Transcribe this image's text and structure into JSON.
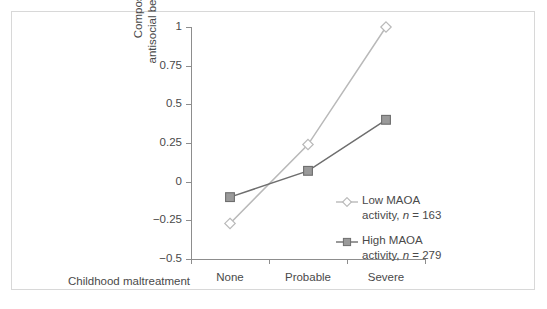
{
  "figure": {
    "frame_color": "#d8d8d8",
    "background": "#ffffff"
  },
  "chart_data": {
    "type": "line",
    "title": "",
    "xlabel": "Childhood maltreatment",
    "ylabel": "Composite index of antisocial behavior (z scores)",
    "ylabel_line1": "Composite index of",
    "ylabel_line2": "antisocial behavior (z scores)",
    "categories": [
      "None",
      "Probable",
      "Severe"
    ],
    "x": [
      0,
      1,
      2
    ],
    "ylim": [
      -0.5,
      1
    ],
    "yticks": [
      1,
      0.75,
      0.5,
      0.25,
      0,
      -0.25,
      -0.5
    ],
    "ytick_labels": [
      "1",
      "0.75",
      "0.5",
      "0.25",
      "0",
      "−0.25",
      "−0.5"
    ],
    "grid": false,
    "legend_position": "inside-right-center",
    "series": [
      {
        "name": "Low MAOA activity, n = 163",
        "label_line1": "Low MAOA",
        "label_line2_prefix": "activity, ",
        "label_line2_italic": "n",
        "label_line2_suffix": " = 163",
        "n": 163,
        "marker": "open-diamond",
        "color": "#b9b9b9",
        "marker_fill": "#ffffff",
        "values": [
          -0.27,
          0.24,
          1.0
        ]
      },
      {
        "name": "High MAOA activity, n = 279",
        "label_line1": "High MAOA",
        "label_line2_prefix": "activity, ",
        "label_line2_italic": "n",
        "label_line2_suffix": " = 279",
        "n": 279,
        "marker": "filled-square",
        "color": "#6e6e6e",
        "marker_fill": "#9a9a9a",
        "values": [
          -0.1,
          0.07,
          0.4
        ]
      }
    ]
  }
}
